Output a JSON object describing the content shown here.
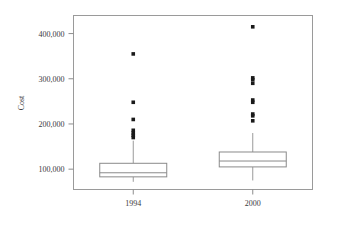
{
  "chart_data": {
    "type": "box",
    "title": "",
    "xlabel": "",
    "ylabel": "Cost",
    "categories": [
      "1994",
      "2000"
    ],
    "ylim": [
      55000,
      440000
    ],
    "yticks": [
      100000,
      200000,
      300000,
      400000
    ],
    "ytick_labels": [
      "100,000",
      "200,000",
      "300,000",
      "400,000"
    ],
    "grid": false,
    "legend": "none",
    "frame": true,
    "series": [
      {
        "name": "1994",
        "whisker_low": 72000,
        "q1": 83000,
        "median": 92000,
        "q3": 113000,
        "whisker_high": 163000,
        "outliers": [
          170000,
          175000,
          180000,
          186000,
          210000,
          248000,
          355000
        ]
      },
      {
        "name": "2000",
        "whisker_low": 75000,
        "q1": 105000,
        "median": 118000,
        "q3": 138000,
        "whisker_high": 180000,
        "outliers": [
          207000,
          218000,
          222000,
          248000,
          253000,
          290000,
          298000,
          302000,
          415000
        ]
      }
    ],
    "colors": {
      "box_fill": "#ffffff",
      "box_stroke": "#8a8a8a",
      "outlier": "#1a1a1a",
      "axis": "#8d8d8d",
      "text": "#3a3a3a",
      "background": "#ffffff"
    }
  }
}
